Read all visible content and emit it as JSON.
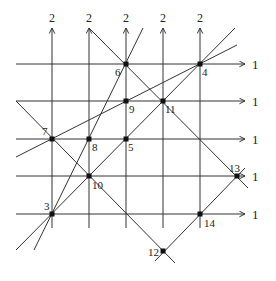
{
  "diagram": {
    "stroke_color": "#333333",
    "point_color": "#111111",
    "vertical_lines": [
      {
        "x": 52,
        "label": "2"
      },
      {
        "x": 89,
        "label": "2"
      },
      {
        "x": 126,
        "label": "2"
      },
      {
        "x": 163,
        "label": "2"
      },
      {
        "x": 200,
        "label": "2"
      }
    ],
    "vertical_range": {
      "top": 28,
      "bottom": 228
    },
    "horizontal_lines": [
      {
        "y": 64,
        "label": "1"
      },
      {
        "y": 101,
        "label": "1"
      },
      {
        "y": 139,
        "label": "1"
      },
      {
        "y": 176,
        "label": "1"
      },
      {
        "y": 214,
        "label": "1"
      }
    ],
    "horizontal_range": {
      "left": 16,
      "right": 245
    },
    "diagonals": [
      {
        "x1": 16,
        "y1": 101,
        "x2": 175,
        "y2": 263
      },
      {
        "x1": 89,
        "y1": 28,
        "x2": 248,
        "y2": 188
      },
      {
        "x1": 16,
        "y1": 250,
        "x2": 235,
        "y2": 28
      },
      {
        "x1": 155,
        "y1": 261,
        "x2": 245,
        "y2": 168
      },
      {
        "x1": 34,
        "y1": 250,
        "x2": 143,
        "y2": 28
      },
      {
        "x1": 16,
        "y1": 157,
        "x2": 237,
        "y2": 45
      }
    ],
    "points": [
      {
        "id": "3",
        "x": 52,
        "y": 214,
        "lx": 44,
        "ly": 210
      },
      {
        "id": "4",
        "x": 200,
        "y": 64,
        "lx": 202,
        "ly": 76
      },
      {
        "id": "5",
        "x": 126,
        "y": 139,
        "lx": 128,
        "ly": 151
      },
      {
        "id": "6",
        "x": 126,
        "y": 64,
        "lx": 115,
        "ly": 76
      },
      {
        "id": "7",
        "x": 52,
        "y": 139,
        "lx": 42,
        "ly": 135
      },
      {
        "id": "8",
        "x": 89,
        "y": 139,
        "lx": 92,
        "ly": 151
      },
      {
        "id": "9",
        "x": 126,
        "y": 101,
        "lx": 129,
        "ly": 113
      },
      {
        "id": "10",
        "x": 89,
        "y": 176,
        "lx": 92,
        "ly": 189
      },
      {
        "id": "11",
        "x": 163,
        "y": 101,
        "lx": 165,
        "ly": 113
      },
      {
        "id": "12",
        "x": 163,
        "y": 251,
        "lx": 148,
        "ly": 256
      },
      {
        "id": "13",
        "x": 237,
        "y": 176,
        "lx": 229,
        "ly": 172
      },
      {
        "id": "14",
        "x": 200,
        "y": 214,
        "lx": 204,
        "ly": 227
      }
    ]
  }
}
